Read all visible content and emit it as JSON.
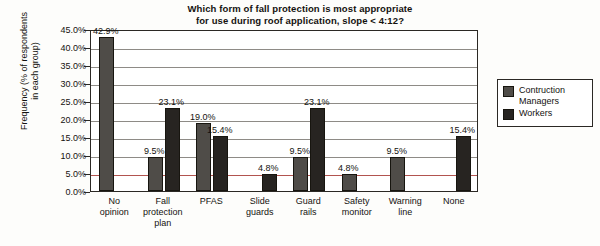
{
  "chart_data": {
    "type": "bar",
    "title": "Which form of fall protection is most appropriate for use during roof application, slope < 4:12?",
    "title_line1": "Which form of fall protection is most appropriate",
    "title_line2": "for use during roof application, slope < 4:12?",
    "xlabel": "",
    "ylabel": "Frequency (% of respondents in each group)",
    "ylabel_line1": "Frequency (% of respondents",
    "ylabel_line2": "in each group)",
    "ylim": [
      0,
      45
    ],
    "ytick_step": 5,
    "ytick_labels": [
      "45.0%",
      "40.0%",
      "35.0%",
      "30.0%",
      "25.0%",
      "20.0%",
      "15.0%",
      "10.0%",
      "5.0%",
      "0.0%"
    ],
    "grid": true,
    "legend_position": "right",
    "categories": [
      "No opinion",
      "Fall protection plan",
      "PFAS",
      "Slide guards",
      "Guard rails",
      "Safety monitor",
      "Warning line",
      "None"
    ],
    "category_lines": [
      [
        "No",
        "opinion"
      ],
      [
        "Fall",
        "protection",
        "plan"
      ],
      [
        "PFAS"
      ],
      [
        "Slide",
        "guards"
      ],
      [
        "Guard",
        "rails"
      ],
      [
        "Safety",
        "monitor"
      ],
      [
        "Warning",
        "line"
      ],
      [
        "None"
      ]
    ],
    "series": [
      {
        "name": "Contruction Managers",
        "name_line1": "Contruction",
        "name_line2": "Managers",
        "color": "#4f4c48",
        "values": [
          42.9,
          9.5,
          19.0,
          null,
          9.5,
          4.8,
          9.5,
          null
        ],
        "labels": [
          "42.9%",
          "9.5%",
          "19.0%",
          "",
          "9.5%",
          "4.8%",
          "9.5%",
          ""
        ]
      },
      {
        "name": "Workers",
        "name_line1": "Workers",
        "name_line2": "",
        "color": "#272421",
        "values": [
          null,
          23.1,
          15.4,
          4.8,
          23.1,
          null,
          null,
          15.4
        ],
        "labels": [
          "",
          "23.1%",
          "15.4%",
          "4.8%",
          "23.1%",
          "",
          "",
          "15.4%"
        ]
      }
    ]
  },
  "legend": {
    "items": [
      {
        "label_line1": "Contruction",
        "label_line2": "Managers",
        "swatch": "managers"
      },
      {
        "label_line1": "Workers",
        "label_line2": "",
        "swatch": "workers"
      }
    ]
  }
}
